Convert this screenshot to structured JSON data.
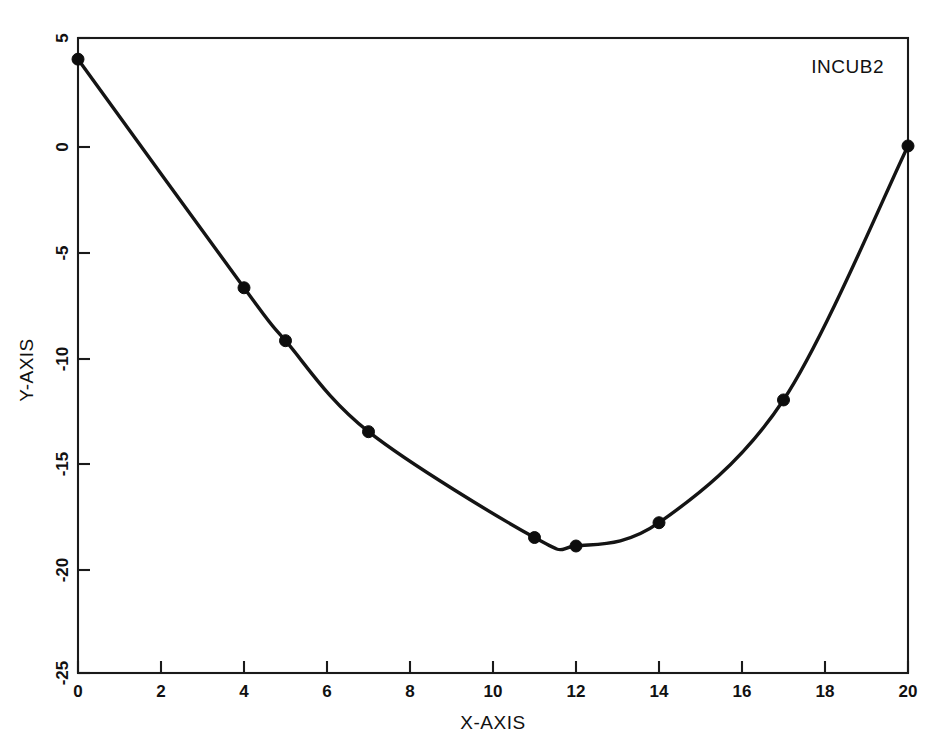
{
  "chart_data": {
    "type": "line",
    "title": "",
    "subtitle": "",
    "xlabel": "X-AXIS",
    "ylabel": "Y-AXIS",
    "xlim": [
      0,
      20
    ],
    "ylim": [
      -25,
      5
    ],
    "grid": false,
    "legend_position": "top-right-inside",
    "annotations": [
      {
        "text": "INCUB2",
        "x": 18.6,
        "y": 3.7
      }
    ],
    "xticks": [
      0,
      2,
      4,
      6,
      8,
      10,
      12,
      14,
      16,
      18,
      20
    ],
    "xticklabels": [
      "0",
      "2",
      "4",
      "6",
      "8",
      "10",
      "12",
      "14",
      "16",
      "18",
      "20"
    ],
    "yticks": [
      5,
      0,
      -5,
      -10,
      -15,
      -20,
      -25
    ],
    "yticklabels": [
      "5",
      "0",
      "-5",
      "-10",
      "-15",
      "-20",
      "-25"
    ],
    "ytick_label_rotation": 90,
    "ylabel_rotation": 90,
    "series": [
      {
        "name": "INCUB2",
        "marker": "filled-circle",
        "line_style": "solid",
        "color": "#141414",
        "x": [
          0,
          4,
          5,
          7,
          11,
          12,
          14,
          17,
          20
        ],
        "values": [
          4.0,
          -6.8,
          -9.3,
          -13.6,
          -18.6,
          -19.0,
          -17.9,
          -12.1,
          -0.1
        ]
      }
    ]
  },
  "figure": {
    "annotation_label": "INCUB2",
    "x_axis_title": "X-AXIS",
    "y_axis_title": "Y-AXIS"
  }
}
